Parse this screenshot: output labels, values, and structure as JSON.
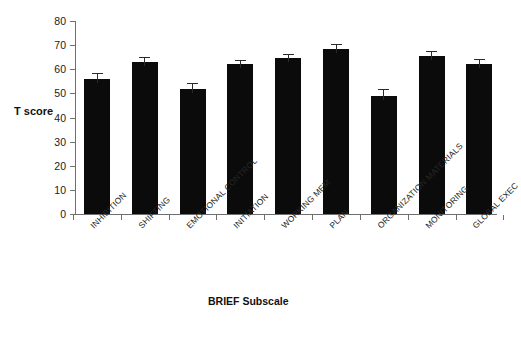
{
  "chart_data": {
    "type": "bar",
    "title": "",
    "xlabel": "BRIEF Subscale",
    "ylabel": "T score",
    "ylim": [
      0,
      80
    ],
    "yticks": [
      0,
      10,
      20,
      30,
      40,
      50,
      60,
      70,
      80
    ],
    "grid": false,
    "legend": null,
    "bar_color": "#0b0b0b",
    "axis_color": "#6f6f6f",
    "categories": [
      "INHIBITION",
      "SHIFTING",
      "EMOTIONAL CONTROL",
      "INITIATION",
      "WORKING MEM",
      "PLAN",
      "ORGANIZATION MATERIALS",
      "MONITORING",
      "GLOBAL EXEC"
    ],
    "values": [
      56,
      63,
      52,
      62,
      64.5,
      68.5,
      49,
      65.5,
      62
    ],
    "errors": [
      2.0,
      1.5,
      2.0,
      1.5,
      1.5,
      1.5,
      2.5,
      1.8,
      1.8
    ],
    "error_type": "standard error"
  },
  "ytick_labels": [
    "0",
    "10",
    "20",
    "30",
    "40",
    "50",
    "60",
    "70",
    "80"
  ]
}
